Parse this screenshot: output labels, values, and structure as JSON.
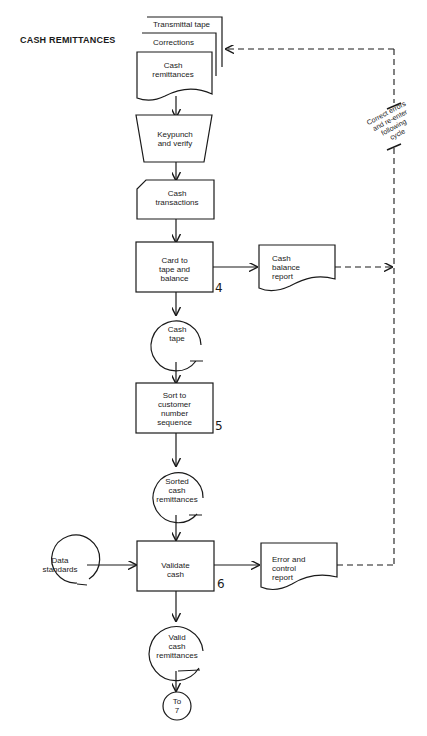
{
  "diagram": {
    "title": "CASH REMITTANCES",
    "stacked_documents": {
      "back": "Transmittal tape",
      "middle": "Corrections",
      "front": "Cash remittances"
    },
    "nodes": [
      {
        "id": "keypunch",
        "shape": "manual-operation",
        "label": "Keypunch and verify"
      },
      {
        "id": "cash_transactions",
        "shape": "punched-card",
        "label": "Cash transactions"
      },
      {
        "id": "card_to_tape",
        "shape": "process",
        "label": "Card to tape and balance",
        "step": "4"
      },
      {
        "id": "cash_balance_report",
        "shape": "document",
        "label": "Cash balance report"
      },
      {
        "id": "cash_tape",
        "shape": "magnetic-tape",
        "label": "Cash tape"
      },
      {
        "id": "sort",
        "shape": "process",
        "label": "Sort to customer number sequence",
        "step": "5"
      },
      {
        "id": "sorted_cash",
        "shape": "magnetic-tape",
        "label": "Sorted cash remittances"
      },
      {
        "id": "data_standards",
        "shape": "magnetic-tape",
        "label": "Data standards"
      },
      {
        "id": "validate",
        "shape": "process",
        "label": "Validate cash",
        "step": "6"
      },
      {
        "id": "error_report",
        "shape": "document",
        "label": "Error and control report"
      },
      {
        "id": "valid_cash",
        "shape": "magnetic-tape",
        "label": "Valid cash remittances"
      },
      {
        "id": "connector",
        "shape": "connector",
        "label": "To 7"
      }
    ],
    "labels": {
      "transmittal": "Transmittal tape",
      "corrections": "Corrections",
      "cash_remit_1": "Cash",
      "cash_remit_2": "remittances",
      "keypunch_1": "Keypunch",
      "keypunch_2": "and verify",
      "trans_1": "Cash",
      "trans_2": "transactions",
      "card_1": "Card to",
      "card_2": "tape and",
      "card_3": "balance",
      "step4": "4",
      "balrep_1": "Cash",
      "balrep_2": "balance",
      "balrep_3": "report",
      "tape_1": "Cash",
      "tape_2": "tape",
      "sort_1": "Sort to",
      "sort_2": "customer",
      "sort_3": "number",
      "sort_4": "sequence",
      "step5": "5",
      "sorted_1": "Sorted",
      "sorted_2": "cash",
      "sorted_3": "remittances",
      "ds_1": "Data",
      "ds_2": "standards",
      "validate_1": "Validate",
      "validate_2": "cash",
      "step6": "6",
      "err_1": "Error and",
      "err_2": "control",
      "err_3": "report",
      "valid_1": "Valid",
      "valid_2": "cash",
      "valid_3": "remittances",
      "to_1": "To",
      "to_2": "7",
      "note_1": "Correct errors",
      "note_2": "and re-enter",
      "note_3": "following",
      "note_4": "cycle"
    },
    "feedback_note": "Correct errors and re-enter following cycle"
  }
}
